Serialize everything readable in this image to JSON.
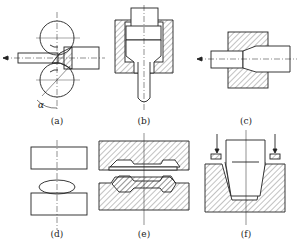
{
  "figure": {
    "panels": [
      {
        "id": "a",
        "caption": "(a)",
        "process": "rolling",
        "annotation": "α"
      },
      {
        "id": "b",
        "caption": "(b)",
        "process": "extrusion"
      },
      {
        "id": "c",
        "caption": "(c)",
        "process": "drawing"
      },
      {
        "id": "d",
        "caption": "(d)",
        "process": "free forging"
      },
      {
        "id": "e",
        "caption": "(e)",
        "process": "die forging"
      },
      {
        "id": "f",
        "caption": "(f)",
        "process": "deep drawing / stamping"
      }
    ],
    "colors": {
      "line": "#222222",
      "background": "#ffffff"
    }
  }
}
